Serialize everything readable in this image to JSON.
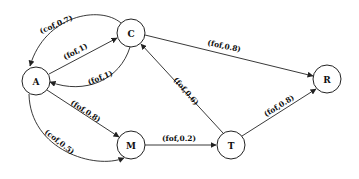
{
  "diagram": {
    "nodes": [
      {
        "id": "A",
        "label": "A",
        "cx": 36,
        "cy": 81
      },
      {
        "id": "C",
        "label": "C",
        "cx": 131,
        "cy": 33
      },
      {
        "id": "R",
        "label": "R",
        "cx": 327,
        "cy": 79
      },
      {
        "id": "M",
        "label": "M",
        "cx": 131,
        "cy": 145
      },
      {
        "id": "T",
        "label": "T",
        "cx": 231,
        "cy": 145
      }
    ],
    "edges": [
      {
        "from": "C",
        "to": "A",
        "label": "(cof,0.7)"
      },
      {
        "from": "A",
        "to": "C",
        "label": "(fof,1)"
      },
      {
        "from": "C",
        "to": "A",
        "label": "(fof,1)"
      },
      {
        "from": "C",
        "to": "R",
        "label": "(fof,0.8)"
      },
      {
        "from": "A",
        "to": "M",
        "label": "(fof,0.8)"
      },
      {
        "from": "A",
        "to": "M",
        "label": "(cof,0.5)"
      },
      {
        "from": "T",
        "to": "C",
        "label": "(fof,0.6)"
      },
      {
        "from": "M",
        "to": "T",
        "label": "(fof,0.2)"
      },
      {
        "from": "T",
        "to": "R",
        "label": "(fof,0.8)"
      }
    ]
  }
}
